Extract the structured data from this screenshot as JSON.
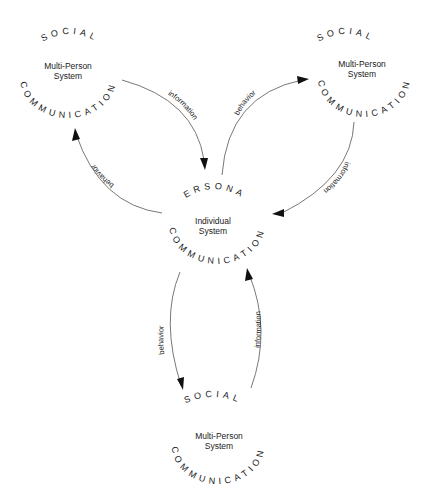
{
  "diagram": {
    "nodes": [
      {
        "id": "social-top-left",
        "top_arc_label": "SOCIAL",
        "center_line1": "Multi-Person",
        "center_line2": "System",
        "bottom_arc_label": "COMMUNICATION"
      },
      {
        "id": "social-top-right",
        "top_arc_label": "SOCIAL",
        "center_line1": "Multi-Person",
        "center_line2": "System",
        "bottom_arc_label": "COMMUNICATION"
      },
      {
        "id": "personal-center",
        "top_arc_label": "PERSONAL",
        "center_line1": "Individual",
        "center_line2": "System",
        "bottom_arc_label": "COMMUNICATION"
      },
      {
        "id": "social-bottom",
        "top_arc_label": "SOCIAL",
        "center_line1": "Multi-Person",
        "center_line2": "System",
        "bottom_arc_label": "COMMUNICATION"
      }
    ],
    "edges": [
      {
        "from": "social-top-left",
        "to": "personal-center",
        "label": "information"
      },
      {
        "from": "personal-center",
        "to": "social-top-left",
        "label": "behavior"
      },
      {
        "from": "personal-center",
        "to": "social-top-right",
        "label": "behavior"
      },
      {
        "from": "social-top-right",
        "to": "personal-center",
        "label": "information"
      },
      {
        "from": "personal-center",
        "to": "social-bottom",
        "label": "behavior"
      },
      {
        "from": "social-bottom",
        "to": "personal-center",
        "label": "information"
      }
    ]
  }
}
